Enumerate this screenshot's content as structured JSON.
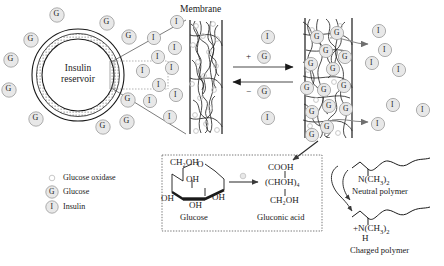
{
  "figure": {
    "membrane_title": "Membrane",
    "reservoir_line1": "Insulin",
    "reservoir_line2": "reservoir",
    "glucose_symbol": "G",
    "insulin_symbol": "I",
    "forward_label_sign": "+",
    "forward_label_species": "G",
    "reverse_label_sign": "−",
    "reverse_label_species": "G"
  },
  "legend": {
    "items": [
      {
        "symbol": "",
        "label": "Glucose oxidase",
        "icon": "small-open-circle-icon"
      },
      {
        "symbol": "G",
        "label": "Glucose",
        "icon": "glucose-circle-icon"
      },
      {
        "symbol": "I",
        "label": "Insulin",
        "icon": "insulin-circle-icon"
      }
    ]
  },
  "reaction": {
    "glucose_label": "Glucose",
    "product_label": "Gluconic acid",
    "glucose_top_group": "CH₂OH",
    "ring_oxygen": "O",
    "glucose_oh_left_upper": "OH",
    "glucose_oh_left_lower": "OH",
    "glucose_oh_bottom": "OH",
    "glucose_oh_right": "OH",
    "product_top": "COOH",
    "product_middle": "(CHOH)₄",
    "product_bottom": "CH₂OH",
    "catalyst_icon": "glucose-oxidase-icon"
  },
  "polymers": {
    "neutral": {
      "formula_main": "N(CH",
      "formula_sub": "3",
      "formula_tail": ")",
      "formula_sub2": "2",
      "label": "Neutral polymer",
      "charge": ""
    },
    "charged": {
      "charge": "+",
      "formula_main": "N(CH",
      "formula_sub": "3",
      "formula_tail": ")",
      "formula_sub2": "2",
      "hydrogen": "H",
      "label": "Charged polymer"
    }
  },
  "colors": {
    "stroke": "#1a1a1a",
    "molecule_fill": "#e8e8e8",
    "molecule_stroke": "#9a9a9a",
    "arrow_gray": "#6f6f6f",
    "oxidase_stroke": "#c2c2c2",
    "mesh": "#2a2a2a"
  }
}
